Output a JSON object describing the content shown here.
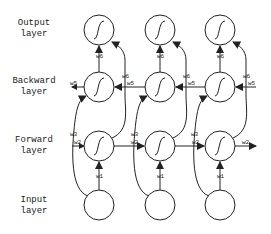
{
  "diagram": {
    "layers": [
      {
        "id": "output",
        "line1": "Output",
        "line2": "layer"
      },
      {
        "id": "backward",
        "line1": "Backward",
        "line2": "layer"
      },
      {
        "id": "forward",
        "line1": "Forward",
        "line2": "layer"
      },
      {
        "id": "input",
        "line1": "Input",
        "line2": "layer"
      }
    ],
    "timesteps": 3,
    "node_symbol": "∫",
    "weights": {
      "w1": "w1",
      "w2": "w2",
      "w3": "w3",
      "w5": "w5",
      "w6": "w6",
      "w6_out": "w6"
    },
    "colors": {
      "stroke": "#222222",
      "background": "#ffffff"
    }
  }
}
